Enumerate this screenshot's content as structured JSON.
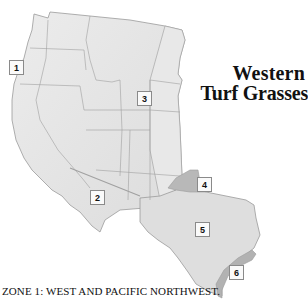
{
  "map": {
    "title_line1": "Western",
    "title_line2": "Turf Grasses",
    "caption": "ZONE 1: WEST AND PACIFIC NORTHWEST.",
    "colors": {
      "land": "#e4e4e4",
      "border": "#9a9a9a",
      "zone4": "#b8b8b8",
      "zone6": "#b2b2b2",
      "texas": "#dedede"
    },
    "zones": [
      {
        "id": 1,
        "label": "1",
        "x": 9,
        "y": 60
      },
      {
        "id": 2,
        "label": "2",
        "x": 90,
        "y": 190
      },
      {
        "id": 3,
        "label": "3",
        "x": 137,
        "y": 91
      },
      {
        "id": 4,
        "label": "4",
        "x": 197,
        "y": 177
      },
      {
        "id": 5,
        "label": "5",
        "x": 195,
        "y": 222
      },
      {
        "id": 6,
        "label": "6",
        "x": 229,
        "y": 265
      }
    ]
  }
}
